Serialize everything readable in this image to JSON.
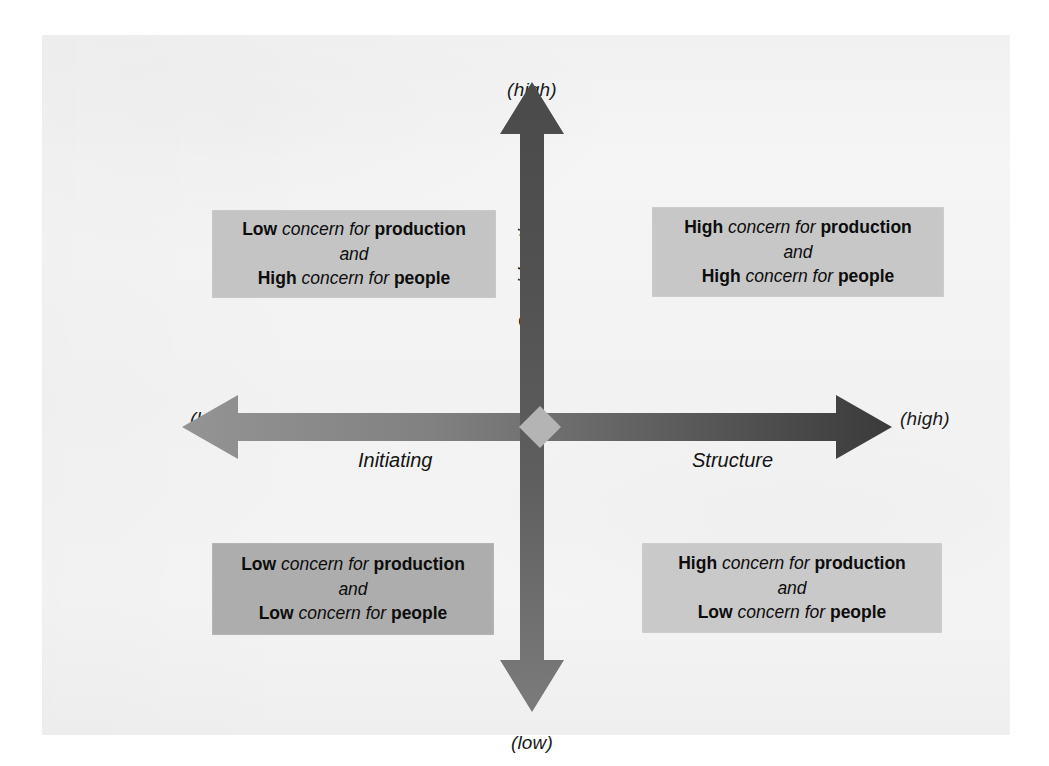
{
  "figure": {
    "type": "two-axis quadrant diagram",
    "background_color": "#f3f3f3",
    "page_background": "#ffffff"
  },
  "axes": {
    "vertical": {
      "name": "Consideration",
      "top_label": "(high)",
      "bottom_label": "(low)",
      "color_top": "#4d4d4d",
      "color_bottom": "#737373"
    },
    "horizontal": {
      "name_left": "Initiating",
      "name_right": "Structure",
      "left_label": "(low)",
      "right_label": "(high)",
      "color_left": "#8a8a8a",
      "color_right": "#3f3f3f"
    },
    "center_marker": {
      "shape": "diamond",
      "color": "#b2b2b2"
    }
  },
  "quadrants": [
    {
      "position": "top-left",
      "background_color": "#c4c4c4",
      "line1": {
        "word1": "Low",
        "phrase": "concern for",
        "word2": "production"
      },
      "conjunction": "and",
      "line2": {
        "word1": "High",
        "phrase": "concern for",
        "word2": "people"
      }
    },
    {
      "position": "top-right",
      "background_color": "#c7c7c7",
      "line1": {
        "word1": "High",
        "phrase": "concern for",
        "word2": "production"
      },
      "conjunction": "and",
      "line2": {
        "word1": "High",
        "phrase": "concern for",
        "word2": "people"
      }
    },
    {
      "position": "bottom-left",
      "background_color": "#adadad",
      "line1": {
        "word1": "Low",
        "phrase": "concern for",
        "word2": "production"
      },
      "conjunction": "and",
      "line2": {
        "word1": "Low",
        "phrase": "concern for",
        "word2": "people"
      }
    },
    {
      "position": "bottom-right",
      "background_color": "#c9c9c9",
      "line1": {
        "word1": "High",
        "phrase": "concern for",
        "word2": "production"
      },
      "conjunction": "and",
      "line2": {
        "word1": "Low",
        "phrase": "concern for",
        "word2": "people"
      }
    }
  ]
}
